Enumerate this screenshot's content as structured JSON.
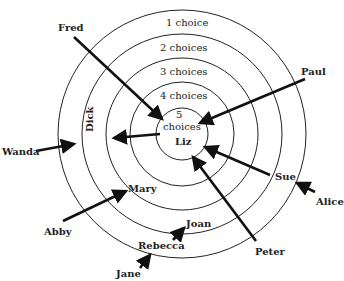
{
  "rings": [
    {
      "label": "1 choice",
      "r": 126
    },
    {
      "label": "2 choices",
      "r": 101
    },
    {
      "label": "3 choices",
      "r": 77
    },
    {
      "label": "4 choices",
      "r": 52
    },
    {
      "label": "5",
      "label2": "choices",
      "r": 26
    }
  ],
  "people": {
    "fred": "Fred",
    "paul": "Paul",
    "wanda": "Wanda",
    "dick": "Dick",
    "liz": "Liz",
    "mary": "Mary",
    "abby": "Abby",
    "sue": "Sue",
    "alice": "Alice",
    "joan": "Joan",
    "rebecca": "Rebecca",
    "peter": "Peter",
    "jane": "Jane"
  },
  "choices": [
    {
      "from": "Fred",
      "to": "Liz"
    },
    {
      "from": "Paul",
      "to": "Liz"
    },
    {
      "from": "Wanda",
      "to": "Dick"
    },
    {
      "from": "Liz",
      "to": "Dick"
    },
    {
      "from": "Abby",
      "to": "Mary"
    },
    {
      "from": "Sue",
      "to": "Liz"
    },
    {
      "from": "Alice",
      "to": "Sue"
    },
    {
      "from": "Peter",
      "to": "Liz"
    },
    {
      "from": "Rebecca",
      "to": "Joan"
    },
    {
      "from": "Jane",
      "to": "Rebecca"
    }
  ]
}
